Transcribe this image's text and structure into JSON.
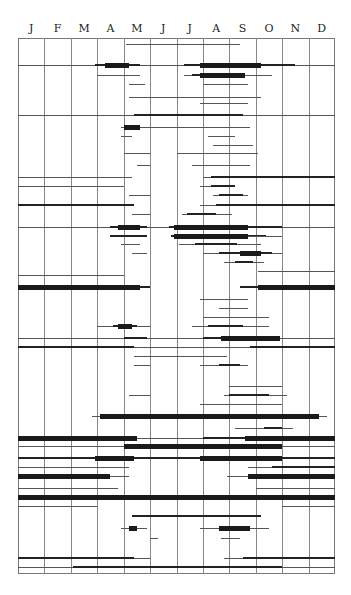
{
  "chart_data": {
    "type": "timeline",
    "title": "",
    "xlabel": "",
    "ylabel": "",
    "categories": [
      "J",
      "F",
      "M",
      "A",
      "M",
      "J",
      "J",
      "A",
      "S",
      "O",
      "N",
      "D"
    ],
    "x_range": [
      0,
      12
    ],
    "grid": true,
    "legend": null,
    "weights_note": "1=thin line, 2=medium line, 3=thick bar",
    "rows": [
      {
        "y": 44,
        "segments": [
          [
            4.1,
            8.4,
            1
          ]
        ]
      },
      {
        "y": 65,
        "segments": [
          [
            0,
            12,
            1
          ],
          [
            2.9,
            4.6,
            2
          ],
          [
            3.3,
            4.2,
            3
          ],
          [
            6.3,
            10.5,
            2
          ],
          [
            6.9,
            9.2,
            3
          ]
        ]
      },
      {
        "y": 75,
        "segments": [
          [
            3.0,
            4.6,
            1
          ],
          [
            3.6,
            4.3,
            1
          ],
          [
            6.3,
            9.6,
            1
          ],
          [
            6.6,
            8.6,
            2
          ],
          [
            6.9,
            8.6,
            3
          ]
        ]
      },
      {
        "y": 84,
        "segments": [
          [
            4.2,
            4.8,
            1
          ],
          [
            7.0,
            8.7,
            1
          ]
        ]
      },
      {
        "y": 97,
        "segments": [
          [
            4.2,
            9.2,
            1
          ]
        ]
      },
      {
        "y": 103,
        "segments": [
          [
            6.9,
            8.7,
            1
          ]
        ]
      },
      {
        "y": 115,
        "segments": [
          [
            0,
            12,
            1
          ],
          [
            4.4,
            8.5,
            2
          ],
          [
            4.7,
            8.2,
            2
          ]
        ]
      },
      {
        "y": 127,
        "segments": [
          [
            3.9,
            8.8,
            1
          ],
          [
            4.0,
            4.6,
            3
          ]
        ]
      },
      {
        "y": 136,
        "segments": [
          [
            3.9,
            4.3,
            1
          ],
          [
            7.2,
            8.2,
            1
          ]
        ]
      },
      {
        "y": 145,
        "segments": [
          [
            7.4,
            8.9,
            1
          ]
        ]
      },
      {
        "y": 153,
        "segments": [
          [
            4.0,
            5.0,
            1
          ],
          [
            6.0,
            9.1,
            1
          ]
        ]
      },
      {
        "y": 165,
        "segments": [
          [
            4.5,
            5.0,
            1
          ],
          [
            6.6,
            8.8,
            1
          ]
        ]
      },
      {
        "y": 177,
        "segments": [
          [
            0,
            4.3,
            1
          ],
          [
            7.0,
            12,
            1
          ],
          [
            7.3,
            12,
            2
          ]
        ]
      },
      {
        "y": 186,
        "segments": [
          [
            0,
            4.0,
            1
          ],
          [
            6.9,
            8.2,
            1
          ],
          [
            7.3,
            8.2,
            2
          ]
        ]
      },
      {
        "y": 195,
        "segments": [
          [
            4.2,
            5.0,
            1
          ],
          [
            7.4,
            8.7,
            1
          ],
          [
            7.6,
            8.5,
            2
          ]
        ]
      },
      {
        "y": 205,
        "segments": [
          [
            0,
            4.4,
            2
          ],
          [
            6.9,
            12,
            1
          ],
          [
            7.5,
            12,
            2
          ]
        ]
      },
      {
        "y": 214,
        "segments": [
          [
            4.3,
            5.0,
            1
          ],
          [
            6.2,
            8.1,
            1
          ],
          [
            6.4,
            7.5,
            2
          ]
        ]
      },
      {
        "y": 227,
        "segments": [
          [
            0,
            12,
            1
          ],
          [
            3.5,
            4.9,
            2
          ],
          [
            3.8,
            4.6,
            3
          ],
          [
            5.7,
            10.0,
            2
          ],
          [
            5.9,
            8.7,
            3
          ]
        ]
      },
      {
        "y": 236,
        "segments": [
          [
            3.5,
            4.9,
            2
          ],
          [
            3.5,
            4.7,
            2
          ],
          [
            5.8,
            9.4,
            2
          ],
          [
            5.9,
            8.7,
            3
          ],
          [
            8.7,
            10.0,
            1
          ]
        ]
      },
      {
        "y": 244,
        "segments": [
          [
            3.9,
            4.6,
            1
          ],
          [
            6.1,
            9.2,
            1
          ],
          [
            6.7,
            8.3,
            2
          ]
        ]
      },
      {
        "y": 253,
        "segments": [
          [
            4.3,
            4.9,
            1
          ],
          [
            7.0,
            10.0,
            1
          ],
          [
            7.6,
            9.6,
            2
          ],
          [
            8.4,
            9.2,
            3
          ]
        ]
      },
      {
        "y": 262,
        "segments": [
          [
            7.8,
            9.3,
            1
          ],
          [
            8.2,
            8.9,
            2
          ]
        ]
      },
      {
        "y": 271,
        "segments": [
          [
            9.1,
            12,
            1
          ]
        ]
      },
      {
        "y": 275,
        "segments": [
          [
            0,
            4.0,
            1
          ]
        ]
      },
      {
        "y": 287,
        "segments": [
          [
            0,
            4.6,
            3
          ],
          [
            4.6,
            5.0,
            2
          ],
          [
            8.4,
            12,
            2
          ],
          [
            9.1,
            12,
            3
          ]
        ]
      },
      {
        "y": 299,
        "segments": [
          [
            6.9,
            8.7,
            1
          ]
        ]
      },
      {
        "y": 308,
        "segments": [
          [
            7.6,
            8.7,
            1
          ]
        ]
      },
      {
        "y": 317,
        "segments": [
          [
            7.0,
            9.5,
            1
          ]
        ]
      },
      {
        "y": 326,
        "segments": [
          [
            3.0,
            5.0,
            1
          ],
          [
            3.6,
            4.5,
            2
          ],
          [
            3.8,
            4.3,
            3
          ],
          [
            6.6,
            9.5,
            1
          ],
          [
            7.2,
            8.5,
            2
          ]
        ]
      },
      {
        "y": 338,
        "segments": [
          [
            0,
            12,
            1
          ],
          [
            4.0,
            4.9,
            2
          ],
          [
            6.5,
            10.2,
            1
          ],
          [
            7.0,
            9.9,
            2
          ],
          [
            7.7,
            9.9,
            3
          ]
        ]
      },
      {
        "y": 347,
        "segments": [
          [
            0,
            4.4,
            2
          ],
          [
            4.4,
            8.8,
            1
          ],
          [
            8.8,
            12,
            2
          ]
        ]
      },
      {
        "y": 356,
        "segments": [
          [
            4.4,
            7.9,
            1
          ]
        ]
      },
      {
        "y": 365,
        "segments": [
          [
            4.4,
            5.0,
            1
          ],
          [
            6.9,
            8.7,
            1
          ],
          [
            7.6,
            8.4,
            2
          ]
        ]
      },
      {
        "y": 386,
        "segments": [
          [
            8.0,
            10.0,
            1
          ]
        ]
      },
      {
        "y": 395,
        "segments": [
          [
            4.2,
            5.0,
            1
          ],
          [
            7.8,
            10.2,
            1
          ],
          [
            8.0,
            9.5,
            2
          ]
        ]
      },
      {
        "y": 404,
        "segments": [
          [
            6.9,
            10.0,
            1
          ]
        ]
      },
      {
        "y": 416,
        "segments": [
          [
            2.8,
            11.7,
            1
          ],
          [
            3.1,
            11.4,
            3
          ]
        ]
      },
      {
        "y": 428,
        "segments": [
          [
            8.2,
            10.4,
            1
          ],
          [
            9.3,
            10.0,
            2
          ]
        ]
      },
      {
        "y": 438,
        "segments": [
          [
            0,
            12,
            1
          ],
          [
            0,
            4.5,
            3
          ],
          [
            7.0,
            8.6,
            2
          ],
          [
            8.6,
            12,
            3
          ]
        ]
      },
      {
        "y": 446,
        "segments": [
          [
            0,
            12,
            1
          ],
          [
            4.0,
            10.0,
            3
          ]
        ]
      },
      {
        "y": 458,
        "segments": [
          [
            0,
            12,
            2
          ],
          [
            2.9,
            4.4,
            3
          ],
          [
            6.9,
            10.0,
            3
          ]
        ]
      },
      {
        "y": 467,
        "segments": [
          [
            0,
            4.2,
            1
          ],
          [
            8.7,
            12,
            1
          ],
          [
            9.6,
            12,
            2
          ]
        ]
      },
      {
        "y": 476,
        "segments": [
          [
            0,
            3.5,
            3
          ],
          [
            3.5,
            4.2,
            1
          ],
          [
            7.9,
            8.7,
            1
          ],
          [
            8.7,
            12,
            3
          ]
        ]
      },
      {
        "y": 488,
        "segments": [
          [
            0,
            3.8,
            1
          ],
          [
            9.0,
            12,
            1
          ]
        ]
      },
      {
        "y": 497,
        "segments": [
          [
            0,
            12,
            3
          ]
        ]
      },
      {
        "y": 506,
        "segments": [
          [
            0,
            3.0,
            1
          ],
          [
            10.0,
            12,
            1
          ]
        ]
      },
      {
        "y": 516,
        "segments": [
          [
            4.3,
            9.2,
            2
          ]
        ]
      },
      {
        "y": 528,
        "segments": [
          [
            3.9,
            4.9,
            1
          ],
          [
            4.2,
            4.5,
            3
          ],
          [
            6.9,
            9.5,
            1
          ],
          [
            7.6,
            8.8,
            3
          ]
        ]
      },
      {
        "y": 538,
        "segments": [
          [
            5.0,
            5.3,
            1
          ],
          [
            7.7,
            8.4,
            1
          ]
        ]
      },
      {
        "y": 558,
        "segments": [
          [
            0,
            4.4,
            2
          ],
          [
            4.4,
            5.0,
            1
          ],
          [
            7.8,
            12,
            1
          ],
          [
            8.5,
            12,
            2
          ]
        ]
      },
      {
        "y": 567,
        "segments": [
          [
            0,
            12,
            1
          ],
          [
            2.1,
            10.0,
            2
          ]
        ]
      }
    ]
  },
  "header": {
    "months": [
      "J",
      "F",
      "M",
      "A",
      "M",
      "J",
      "J",
      "A",
      "S",
      "O",
      "N",
      "D"
    ]
  }
}
